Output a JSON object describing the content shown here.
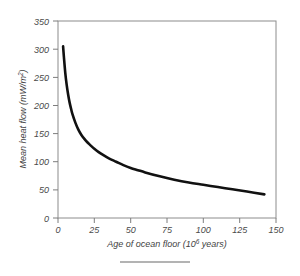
{
  "figure": {
    "background_color": "#ffffff",
    "frame_color": "#8c8c8c",
    "curve_color": "#111111",
    "caption_rule": "caption-rule"
  },
  "chart_data": {
    "type": "line",
    "title": "",
    "xlabel": "Age of ocean floor (10^6 years)",
    "xlabel_main": "Age of ocean floor (10",
    "xlabel_exp": "6",
    "xlabel_tail": " years)",
    "ylabel": "Mean heat flow  (mW/m^2)",
    "ylabel_main": "Mean heat flow  (mW/m",
    "ylabel_exp": "2",
    "ylabel_tail": ")",
    "xlim": [
      0,
      150
    ],
    "ylim": [
      0,
      350
    ],
    "xticks": [
      0,
      25,
      50,
      75,
      100,
      125,
      150
    ],
    "yticks": [
      0,
      50,
      100,
      150,
      200,
      250,
      300,
      350
    ],
    "xtick_labels": [
      "0",
      "25",
      "50",
      "75",
      "100",
      "125",
      "150"
    ],
    "ytick_labels": [
      "0",
      "50",
      "100",
      "150",
      "200",
      "250",
      "300",
      "350"
    ],
    "grid": false,
    "legend": false,
    "series": [
      {
        "name": "Mean heat flow",
        "x": [
          3.5,
          4,
          5,
          6,
          7,
          8,
          9,
          10,
          12,
          14,
          16,
          18,
          20,
          22,
          25,
          28,
          31,
          35,
          40,
          45,
          50,
          55,
          60,
          70,
          80,
          90,
          100,
          110,
          120,
          130,
          142
        ],
        "y": [
          305,
          288,
          258,
          236,
          219,
          205,
          194,
          184,
          169,
          157,
          148,
          141,
          135,
          130,
          123,
          117,
          112,
          106,
          100,
          94,
          89,
          85,
          81,
          74,
          68,
          63,
          59,
          55,
          51,
          47,
          42
        ]
      }
    ]
  },
  "axis_geometry": {
    "plot_left_px": 58,
    "plot_right_px": 276,
    "plot_top_px": 21,
    "plot_bottom_px": 218
  }
}
